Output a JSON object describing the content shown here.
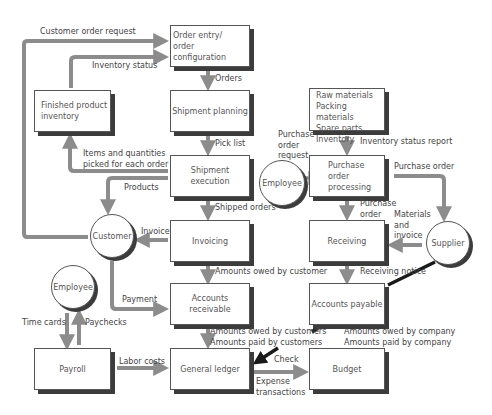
{
  "diagram": {
    "type": "flowchart",
    "colors": {
      "arrow": "#8c8c8c",
      "connector_dark": "#1a1a1a",
      "box_shadow": "#3c3c3c",
      "border": "#555555"
    },
    "nodes": {
      "order_entry": {
        "line1": "Order entry/",
        "line2": "order configuration"
      },
      "shipment_planning": {
        "label": "Shipment planning"
      },
      "shipment_execution": {
        "label": "Shipment execution"
      },
      "invoicing": {
        "label": "Invoicing"
      },
      "accounts_receivable": {
        "line1": "Accounts",
        "line2": "receivable"
      },
      "general_ledger": {
        "label": "General ledger"
      },
      "finished_product_inventory": {
        "line1": "Finished product",
        "line2": "inventory"
      },
      "payroll": {
        "label": "Payroll"
      },
      "materials_inventory": {
        "line1": "Raw materials",
        "line2": "Packing materials",
        "line3": "Spare parts",
        "line4": "Inventory"
      },
      "purchase_order_processing": {
        "line1": "Purchase",
        "line2": "order",
        "line3": "processing"
      },
      "receiving": {
        "label": "Receiving"
      },
      "accounts_payable": {
        "label": "Accounts payable"
      },
      "budget": {
        "label": "Budget"
      },
      "customer": {
        "label": "Customer"
      },
      "employee_left": {
        "label": "Employee"
      },
      "employee_mid": {
        "label": "Employee"
      },
      "supplier": {
        "label": "Supplier"
      }
    },
    "edges": {
      "customer_order_request": "Customer order request",
      "inventory_status": "Inventory status",
      "orders": "Orders",
      "pick_list": "Pick list",
      "items_picked": {
        "line1": "Items and quantities",
        "line2": "picked for each order"
      },
      "products": "Products",
      "shipped_orders": "Shipped orders",
      "invoice": "Invoice",
      "amounts_owed_by_customer": "Amounts owed by customer",
      "payment": "Payment",
      "amounts_customers": {
        "line1": "Amounts owed by customers",
        "line2": "Amounts paid by customers"
      },
      "time_cards": "Time cards",
      "paychecks": "Paychecks",
      "labor_costs": "Labor costs",
      "check": "Check",
      "expense_transactions": {
        "line1": "Expense",
        "line2": "transactions"
      },
      "purchase_order_request": {
        "line1": "Purchase",
        "line2": "order",
        "line3": "request"
      },
      "inventory_status_report": "Inventory status report",
      "purchase_order_to_supplier": "Purchase order",
      "purchase_order_to_receiving": {
        "line1": "Purchase",
        "line2": "order"
      },
      "materials_and_invoice": {
        "line1": "Materials",
        "line2": "and",
        "line3": "invoice"
      },
      "receiving_notice": "Receiving notice",
      "amounts_company": {
        "line1": "Amounts owed by company",
        "line2": "Amounts paid by company"
      }
    }
  }
}
